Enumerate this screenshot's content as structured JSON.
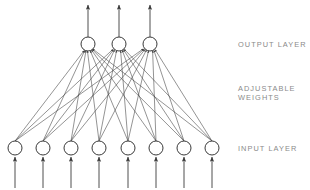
{
  "figure": {
    "background_color": "#ffffff",
    "stroke_color": "#3a3a3a",
    "label_color": "#8a8a8a",
    "width": 310,
    "height": 190
  },
  "labels": {
    "output_layer": "OUTPUT LAYER",
    "adjustable_weights_line1": "ADJUSTABLE",
    "adjustable_weights_line2": "WEIGHTS",
    "input_layer": "INPUT LAYER"
  },
  "network": {
    "node_radius": 7,
    "output_layer": {
      "count": 3,
      "y": 44,
      "x_positions": [
        88,
        119,
        150
      ],
      "arrow_tip_y": 3
    },
    "input_layer": {
      "count": 8,
      "y": 148,
      "x_positions": [
        15,
        43,
        71,
        99,
        128,
        156,
        184,
        212
      ],
      "arrow_tail_y": 188
    },
    "connections": {
      "type": "fully-connected",
      "count": 24,
      "direction": "input-to-output"
    }
  }
}
